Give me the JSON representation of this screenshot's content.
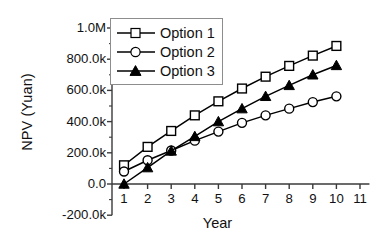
{
  "chart_data": {
    "type": "line",
    "title": "",
    "xlabel": "Year",
    "ylabel": "NPV (Yuan)",
    "x": [
      1,
      2,
      3,
      4,
      5,
      6,
      7,
      8,
      9,
      10
    ],
    "xlim": [
      0.5,
      11.4
    ],
    "ylim": [
      -200000,
      1000000
    ],
    "xticks": [
      "1",
      "2",
      "3",
      "4",
      "5",
      "6",
      "7",
      "8",
      "9",
      "10",
      "11"
    ],
    "xtick_values": [
      1,
      2,
      3,
      4,
      5,
      6,
      7,
      8,
      9,
      10,
      11
    ],
    "yticks": [
      "-200.0k",
      "0.0",
      "200.0k",
      "400.0k",
      "600.0k",
      "800.0k",
      "1.0M"
    ],
    "ytick_values": [
      -200000,
      0,
      200000,
      400000,
      600000,
      800000,
      1000000
    ],
    "grid": false,
    "legend_position": "upper-left-inside",
    "series": [
      {
        "name": "Option 1",
        "marker": "open-square",
        "color": "#000000",
        "values": [
          120000,
          238000,
          340000,
          440000,
          530000,
          612000,
          688000,
          757000,
          823000,
          885000
        ]
      },
      {
        "name": "Option 2",
        "marker": "open-circle",
        "color": "#000000",
        "values": [
          80000,
          152000,
          215000,
          278000,
          336000,
          392000,
          440000,
          483000,
          525000,
          562000
        ]
      },
      {
        "name": "Option 3",
        "marker": "filled-triangle",
        "color": "#000000",
        "values": [
          0,
          105000,
          212000,
          305000,
          400000,
          483000,
          562000,
          632000,
          700000,
          760000
        ]
      }
    ]
  },
  "legend": {
    "items": [
      {
        "label": "Option 1"
      },
      {
        "label": "Option 2"
      },
      {
        "label": "Option 3"
      }
    ]
  },
  "axes": {
    "x_title": "Year",
    "y_title": "NPV (Yuan)"
  }
}
